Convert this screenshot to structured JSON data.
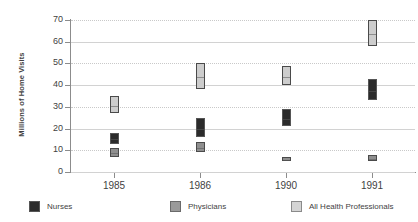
{
  "chart_data": {
    "type": "bar",
    "subtype": "floating-range-bars",
    "title": "",
    "xlabel": "",
    "ylabel": "Millions of Home Visits",
    "categories": [
      "1985",
      "1986",
      "1990",
      "1991"
    ],
    "ylim": [
      0,
      70
    ],
    "yticks": [
      0,
      10,
      20,
      30,
      40,
      50,
      60,
      70
    ],
    "ytick_labels": [
      "0",
      "10",
      "20",
      "30",
      "40",
      "50",
      "60",
      "70"
    ],
    "grid": true,
    "legend_position": "bottom",
    "series": [
      {
        "name": "Nurses",
        "color": "#2b2b2b",
        "low": [
          13,
          16,
          21,
          33
        ],
        "high": [
          18,
          25,
          29,
          43
        ]
      },
      {
        "name": "Physicians",
        "color": "#8f8f8f",
        "low": [
          7,
          9,
          5,
          5
        ],
        "high": [
          11,
          14,
          7,
          8
        ]
      },
      {
        "name": "All Health Professionals",
        "color": "#cdcdcd",
        "low": [
          27,
          38,
          40,
          58
        ],
        "high": [
          35,
          50,
          49,
          70
        ]
      }
    ]
  },
  "legend": {
    "items": [
      {
        "label": "Nurses",
        "swatch": "legend-swatch-nurses"
      },
      {
        "label": "Physicians",
        "swatch": "legend-swatch-physicians"
      },
      {
        "label": "All Health Professionals",
        "swatch": "legend-swatch-all-health-professionals"
      }
    ]
  },
  "colors": {
    "nurses": "#2b2b2b",
    "physicians": "#8f8f8f",
    "all_health_professionals": "#cdcdcd",
    "axis": "#8c8c8c",
    "grid": "#d2d2d2",
    "background": "#ffffff"
  }
}
